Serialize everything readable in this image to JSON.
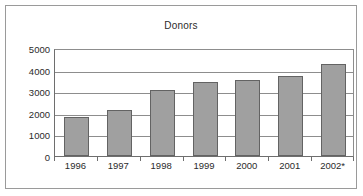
{
  "chart_data": {
    "type": "bar",
    "title": "Donors",
    "xlabel": "",
    "ylabel": "",
    "categories": [
      "1996",
      "1997",
      "1998",
      "1999",
      "2000",
      "2001",
      "2002*"
    ],
    "values": [
      1800,
      2120,
      3060,
      3420,
      3520,
      3700,
      4250
    ],
    "ylim": [
      0,
      5000
    ],
    "ytick_labels": [
      "5000",
      "4000",
      "3000",
      "2000",
      "1000",
      "0"
    ],
    "yticks": [
      5000,
      4000,
      3000,
      2000,
      1000,
      0
    ],
    "grid": true,
    "legend": false,
    "legend_position": "none",
    "series": [
      {
        "name": "Donors",
        "values": [
          1800,
          2120,
          3060,
          3420,
          3520,
          3700,
          4250
        ]
      }
    ],
    "colors": {
      "bar_fill": "#a0a0a0",
      "bar_border": "#636363",
      "gridline": "#8d8d8d",
      "axis": "#6e6e6e",
      "text": "#2b2b2b",
      "frame": "#9a9a9a",
      "background": "#ffffff"
    }
  }
}
